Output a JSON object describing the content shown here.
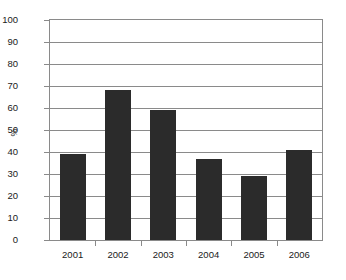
{
  "chart_data": {
    "type": "bar",
    "title": "",
    "subtitle": "",
    "xlabel": "",
    "ylabel": "%",
    "categories": [
      "2001",
      "2002",
      "2003",
      "2004",
      "2005",
      "2006"
    ],
    "values": [
      39,
      68,
      59,
      37,
      29,
      41
    ],
    "ylim": [
      0,
      100
    ],
    "ytick_step": 10,
    "yticks": [
      0,
      10,
      20,
      30,
      40,
      50,
      60,
      70,
      80,
      90,
      100
    ],
    "ytick_labels": [
      "0",
      "10",
      "20",
      "30",
      "40",
      "50",
      "60",
      "70",
      "80",
      "90",
      "100"
    ],
    "grid": true,
    "grid_axis": "y",
    "legend": false,
    "legend_position": "none",
    "bar_color": "#2b2b2b",
    "axis_color": "#8a8a8a",
    "background": "#ffffff"
  }
}
